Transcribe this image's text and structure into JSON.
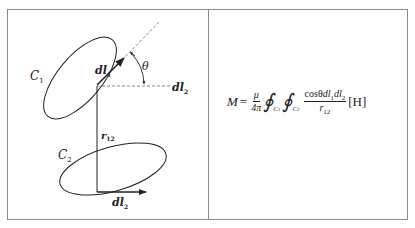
{
  "diagram": {
    "labels": {
      "c1": "C",
      "c1_sub": "1",
      "c2": "C",
      "c2_sub": "2",
      "dl1": "dl",
      "dl1_sub": "1",
      "dl2_dashed": "dl",
      "dl2_dashed_sub": "2",
      "dl2_bottom": "dl",
      "dl2_bottom_sub": "2",
      "r12": "r",
      "r12_sub": "12",
      "theta": "θ"
    },
    "colors": {
      "line": "#222222",
      "dashed": "#555555",
      "border": "#8a8a8a"
    }
  },
  "formula": {
    "lhs": "M",
    "equals": "=",
    "frac_num": "μ",
    "frac_den": "4π",
    "integral": "∮",
    "int1_sub": "C",
    "int1_subsub": "1",
    "int2_sub": "C",
    "int2_subsub": "2",
    "body_num_cos": "cosθ",
    "body_num_dl": "dl",
    "body_num_sub1": "1",
    "body_num_dl2": "dl",
    "body_num_sub2": "2",
    "body_den": "r",
    "body_den_sub": "12",
    "unit": "[H]"
  }
}
